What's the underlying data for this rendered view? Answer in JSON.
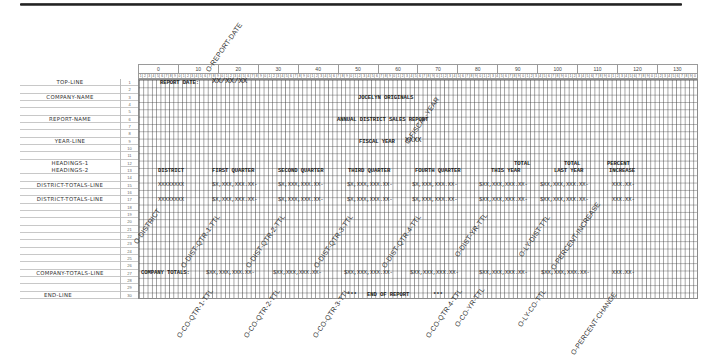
{
  "chart": {
    "column_groups": [
      "0",
      "10",
      "20",
      "30",
      "40",
      "50",
      "60",
      "70",
      "80",
      "90",
      "100",
      "110",
      "120",
      "130"
    ],
    "digit_pattern": [
      "1",
      "2",
      "3",
      "4",
      "5",
      "6",
      "7",
      "8",
      "9",
      "0"
    ],
    "row_numbers": [
      "1",
      "2",
      "3",
      "4",
      "5",
      "6",
      "7",
      "8",
      "9",
      "10",
      "11",
      "12",
      "13",
      "14",
      "15",
      "16",
      "17",
      "18",
      "19",
      "20",
      "21",
      "22",
      "23",
      "24",
      "25",
      "26",
      "27",
      "28",
      "29",
      "30"
    ]
  },
  "record_labels": {
    "r1": "TOP-LINE",
    "r3": "COMPANY-NAME",
    "r6": "REPORT-NAME",
    "r9": "YEAR-LINE",
    "r12": "HEADINGS-1",
    "r13": "HEADINGS-2",
    "r15": "DISTRICT-TOTALS-LINE",
    "r17": "DISTRICT-TOTALS-LINE",
    "r27": "COMPANY-TOTALS-LINE",
    "r30": "END-LINE"
  },
  "lines": {
    "top_line": {
      "label": "REPORT DATE:",
      "date_mask": "XX/XX/XX"
    },
    "company_name": "JOCELYN ORIGINALS",
    "report_name": "ANNUAL DISTRICT SALES REPORT",
    "year_line": {
      "label": "FISCAL YEAR",
      "mask": "XXXX"
    },
    "headings_1": {
      "total_this": "TOTAL",
      "total_last": "TOTAL",
      "percent": "PERCENT"
    },
    "headings_2": {
      "district": "DISTRICT",
      "q1": "FIRST QUARTER",
      "q2": "SECOND QUARTER",
      "q3": "THIRD QUARTER",
      "q4": "FOURTH QUARTER",
      "this_year": "THIS YEAR",
      "last_year": "LAST YEAR",
      "increase": "INCREASE"
    },
    "district_totals": {
      "district": "XXXXXXXX",
      "q1": "$X,XXX,XXX.XX-",
      "q2": "$X,XXX,XXX.XX-",
      "q3": "$X,XXX,XXX.XX-",
      "q4": "$X,XXX,XXX.XX-",
      "this_year": "$XX,XXX,XXX.XX-",
      "last_year": "$XX,XXX,XXX.XX-",
      "percent": "XXX.XX-"
    },
    "company_totals": {
      "label": "COMPANY TOTALS:",
      "q1": "$XX,XXX,XXX.XX-",
      "q2": "$XX,XXX,XXX.XX-",
      "q3": "$XX,XXX,XXX.XX-",
      "q4": "$XX,XXX,XXX.XX-",
      "this_year": "$XX,XXX,XXX.XX-",
      "last_year": "$XX,XXX,XXX.XX-",
      "percent": "XXX.XX-"
    },
    "end_line": {
      "stars_left": "***",
      "text": "END OF REPORT",
      "stars_right": "***"
    }
  },
  "annotations": {
    "report_date": "O-REPORT-DATE",
    "fiscal_year": "O-FISCAL-YEAR",
    "district": "O-DISTRICT",
    "dist_qtr_1": "O-DIST-QTR-1-TTL",
    "dist_qtr_2": "O-DIST-QTR-2-TTL",
    "dist_qtr_3": "O-DIST-QTR-3-TTL",
    "dist_qtr_4": "O-DIST-QTR-4-TTL",
    "dist_yr": "O-DIST-YR-TTL",
    "ly_dist": "O-LY-DIST-TTL",
    "pct_increase": "O-PERCENT-INCREASE",
    "co_qtr_1": "O-CO-QTR-1-TTL",
    "co_qtr_2": "O-CO-QTR-2-TTL",
    "co_qtr_3": "O-CO-QTR-3-TTL",
    "co_qtr_4": "O-CO-QTR-4-TTL",
    "co_yr": "O-CO-YR-TTL",
    "ly_co": "O-LY-CO-TTL",
    "pct_change": "O-PERCENT-CHANGE"
  }
}
